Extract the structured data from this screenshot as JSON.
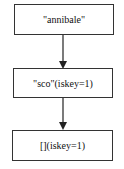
{
  "diagram": {
    "nodes": [
      {
        "id": "n1",
        "label": "\"annibale\""
      },
      {
        "id": "n2",
        "label": "\"sco\"(iskey=1)"
      },
      {
        "id": "n3",
        "label": "[](iskey=1)"
      }
    ],
    "edges": [
      {
        "from": "n1",
        "to": "n2"
      },
      {
        "from": "n2",
        "to": "n3"
      }
    ],
    "colors": {
      "stroke": "#333333",
      "background": "#ffffff"
    }
  }
}
